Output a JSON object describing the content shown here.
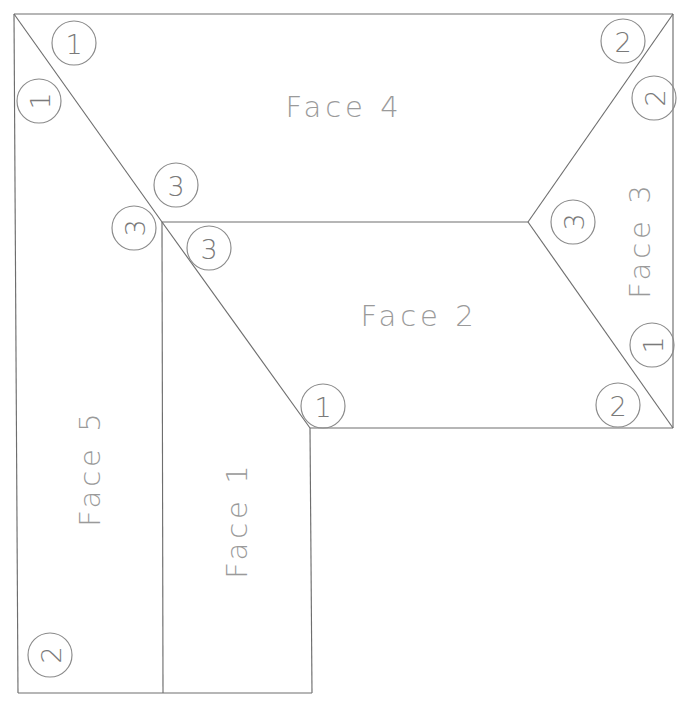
{
  "diagram": {
    "title": "Face 4",
    "type": "unfolded-box-net",
    "line_color": "#6e6e6e",
    "marker_color": "#8a8a8a",
    "label_color": "#9a9a9a",
    "background": "#ffffff",
    "width": 685,
    "height": 706
  },
  "faces": [
    {
      "id": "face-1",
      "label": "Face 1",
      "rotation": -90,
      "cx": 237,
      "cy": 520
    },
    {
      "id": "face-2",
      "label": "Face 2",
      "rotation": 0,
      "cx": 419,
      "cy": 316
    },
    {
      "id": "face-3",
      "label": "Face 3",
      "rotation": -90,
      "cx": 640,
      "cy": 240
    },
    {
      "id": "face-4",
      "label": "Face 4",
      "rotation": 0,
      "cx": 344,
      "cy": 107
    },
    {
      "id": "face-5",
      "label": "Face 5",
      "rotation": -90,
      "cx": 90,
      "cy": 468
    }
  ],
  "markers": [
    {
      "id": "marker-1-a",
      "value": "1",
      "cx": 74,
      "cy": 43,
      "r": 22,
      "rotation": 0
    },
    {
      "id": "marker-1-b",
      "value": "1",
      "cx": 39,
      "cy": 101,
      "r": 22,
      "rotation": -90
    },
    {
      "id": "marker-3-a",
      "value": "3",
      "cx": 176,
      "cy": 185,
      "r": 22,
      "rotation": 0
    },
    {
      "id": "marker-3-b",
      "value": "3",
      "cx": 134,
      "cy": 228,
      "r": 22,
      "rotation": -90
    },
    {
      "id": "marker-3-c",
      "value": "3",
      "cx": 209,
      "cy": 248,
      "r": 22,
      "rotation": 0
    },
    {
      "id": "marker-2-a",
      "value": "2",
      "cx": 623,
      "cy": 41,
      "r": 22,
      "rotation": 0
    },
    {
      "id": "marker-2-b",
      "value": "2",
      "cx": 654,
      "cy": 98,
      "r": 22,
      "rotation": -90
    },
    {
      "id": "marker-3-d",
      "value": "3",
      "cx": 573,
      "cy": 222,
      "r": 22,
      "rotation": -90
    },
    {
      "id": "marker-1-c",
      "value": "1",
      "cx": 652,
      "cy": 345,
      "r": 22,
      "rotation": -90
    },
    {
      "id": "marker-1-d",
      "value": "1",
      "cx": 323,
      "cy": 406,
      "r": 22,
      "rotation": 0
    },
    {
      "id": "marker-2-c",
      "value": "2",
      "cx": 618,
      "cy": 405,
      "r": 22,
      "rotation": 0
    },
    {
      "id": "marker-2-d",
      "value": "2",
      "cx": 50,
      "cy": 655,
      "r": 22,
      "rotation": -90
    }
  ],
  "geometry": {
    "outline_top_left": [
      14,
      14
    ],
    "outline_top_right": [
      673,
      14
    ],
    "junction_left": [
      162,
      222
    ],
    "junction_right": [
      528,
      222
    ],
    "vertex_face1_top": [
      310,
      428
    ],
    "outline_right_bottom": [
      673,
      428
    ],
    "outline_bottom_left": [
      18,
      693
    ],
    "outline_bottom_right": [
      312,
      693
    ],
    "divider_x": 163
  }
}
